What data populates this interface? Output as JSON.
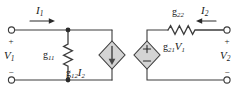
{
  "diagram": {
    "colors": {
      "wire": "#3c3c3c",
      "fill": "#d4d4d4",
      "text": "#1a1a1a",
      "background": "#ffffff"
    },
    "left_port": {
      "voltage_label": "V",
      "voltage_sub": "1",
      "plus": "+",
      "minus": "−",
      "current_label": "I",
      "current_sub": "1",
      "current_direction": "right"
    },
    "right_port": {
      "voltage_label": "V",
      "voltage_sub": "2",
      "plus": "+",
      "minus": "−",
      "current_label": "I",
      "current_sub": "2",
      "current_direction": "left"
    },
    "elements": [
      {
        "name": "conductance-g11",
        "type": "resistor",
        "label": "g",
        "sub": "11",
        "orientation": "vertical"
      },
      {
        "name": "dependent-current-source",
        "type": "current-source",
        "label": "g",
        "sub": "12",
        "factor": "I",
        "factor_sub": "2",
        "arrow_direction": "down"
      },
      {
        "name": "dependent-voltage-source",
        "type": "voltage-source",
        "label": "g",
        "sub": "21",
        "factor": "V",
        "factor_sub": "1",
        "plus": "+",
        "minus": "−"
      },
      {
        "name": "conductance-g22",
        "type": "resistor",
        "label": "g",
        "sub": "22",
        "orientation": "horizontal"
      }
    ]
  }
}
